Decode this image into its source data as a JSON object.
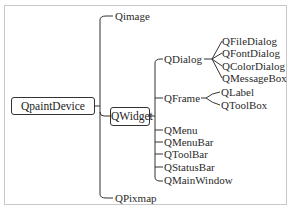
{
  "diagram": {
    "type": "class-hierarchy-tree",
    "root": {
      "label": "QpaintDevice",
      "children": [
        {
          "label": "Qimage"
        },
        {
          "label": "QWidget",
          "children": [
            {
              "label": "QDialog",
              "children": [
                {
                  "label": "QFileDialog"
                },
                {
                  "label": "QFontDialog"
                },
                {
                  "label": "QColorDialog"
                },
                {
                  "label": "QMessageBox"
                }
              ]
            },
            {
              "label": "QFrame",
              "children": [
                {
                  "label": "QLabel"
                },
                {
                  "label": "QToolBox"
                }
              ]
            },
            {
              "label": "QMenu"
            },
            {
              "label": "QMenuBar"
            },
            {
              "label": "QToolBar"
            },
            {
              "label": "QStatusBar"
            },
            {
              "label": "QMainWindow"
            }
          ]
        },
        {
          "label": "QPixmap"
        }
      ]
    }
  },
  "nodes": {
    "root": "QpaintDevice",
    "qimage": "Qimage",
    "qwidget": "QWidget",
    "qpixmap": "QPixmap",
    "qdialog": "QDialog",
    "qframe": "QFrame",
    "qfiledialog": "QFileDialog",
    "qfontdialog": "QFontDialog",
    "qcolordialog": "QColorDialog",
    "qmessagebox": "QMessageBox",
    "qlabel": "QLabel",
    "qtoolbox": "QToolBox",
    "qmenu": "QMenu",
    "qmenubar": "QMenuBar",
    "qtoolbar": "QToolBar",
    "qstatusbar": "QStatusBar",
    "qmainwindow": "QMainWindow"
  },
  "colors": {
    "line": "#333333",
    "text": "#2a2a2a",
    "frame": "#c8c8c8"
  }
}
